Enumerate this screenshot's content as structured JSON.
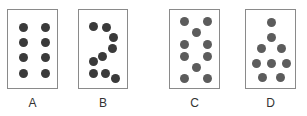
{
  "figure": {
    "cards": [
      {
        "label": "A",
        "box": {
          "x": 7,
          "w": 51
        },
        "dot_color": "#3a3a3a",
        "dots": [
          [
            23,
            27
          ],
          [
            45,
            27
          ],
          [
            23,
            42
          ],
          [
            45,
            42
          ],
          [
            23,
            57
          ],
          [
            45,
            57
          ],
          [
            23,
            73
          ],
          [
            45,
            73
          ]
        ]
      },
      {
        "label": "B",
        "box": {
          "x": 78,
          "w": 50
        },
        "dot_color": "#3a3a3a",
        "dots": [
          [
            93,
            26
          ],
          [
            106,
            27
          ],
          [
            113,
            37
          ],
          [
            112,
            48
          ],
          [
            102,
            56
          ],
          [
            93,
            61
          ],
          [
            93,
            73
          ],
          [
            105,
            73
          ],
          [
            115,
            78
          ]
        ]
      },
      {
        "label": "C",
        "box": {
          "x": 169,
          "w": 51
        },
        "dot_color": "#5c5c5c",
        "dots": [
          [
            184,
            21
          ],
          [
            207,
            21
          ],
          [
            196,
            32
          ],
          [
            184,
            44
          ],
          [
            207,
            44
          ],
          [
            184,
            56
          ],
          [
            207,
            56
          ],
          [
            196,
            67
          ],
          [
            184,
            78
          ],
          [
            207,
            78
          ]
        ]
      },
      {
        "label": "D",
        "box": {
          "x": 245,
          "w": 51
        },
        "dot_color": "#5c5c5c",
        "dots": [
          [
            271,
            22
          ],
          [
            271,
            37
          ],
          [
            261,
            48
          ],
          [
            281,
            48
          ],
          [
            256,
            63
          ],
          [
            271,
            63
          ],
          [
            286,
            63
          ],
          [
            262,
            77
          ],
          [
            280,
            77
          ]
        ]
      }
    ]
  }
}
